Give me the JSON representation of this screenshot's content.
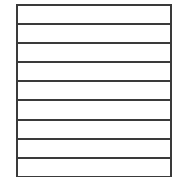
{
  "lined_box": {
    "row_count": 9,
    "rows": [
      {
        "text": ""
      },
      {
        "text": ""
      },
      {
        "text": ""
      },
      {
        "text": ""
      },
      {
        "text": ""
      },
      {
        "text": ""
      },
      {
        "text": ""
      },
      {
        "text": ""
      },
      {
        "text": ""
      }
    ],
    "line_color": "#3a3a3a",
    "background_color": "#ffffff"
  }
}
